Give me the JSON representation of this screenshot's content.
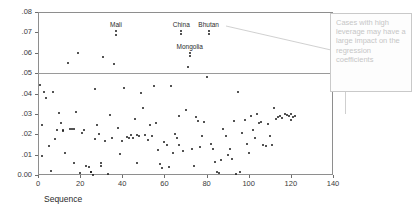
{
  "chart_data": {
    "type": "scatter",
    "title": "",
    "xlabel": "Sequence",
    "ylabel": "Leverage",
    "xlim": [
      0,
      140
    ],
    "ylim": [
      0.0,
      0.08
    ],
    "xticks": [
      "0",
      "20",
      "40",
      "60",
      "80",
      "100",
      "120",
      "140"
    ],
    "xtick_values": [
      0,
      20,
      40,
      60,
      80,
      100,
      120,
      140
    ],
    "yticks": [
      "0.00",
      ".01",
      ".02",
      ".03",
      ".04",
      ".05",
      ".06",
      ".07",
      ".08"
    ],
    "ytick_values": [
      0.0,
      0.01,
      0.02,
      0.03,
      0.04,
      0.05,
      0.06,
      0.07,
      0.08
    ],
    "grid": false,
    "legend": null,
    "reference_lines": [
      {
        "axis": "y",
        "value": 0.05,
        "label": ""
      }
    ],
    "annotations": [
      {
        "text": "Mali",
        "x": 37,
        "y": 0.0707
      },
      {
        "text": "China",
        "x": 68,
        "y": 0.0707
      },
      {
        "text": "Bhutan",
        "x": 81,
        "y": 0.0706
      },
      {
        "text": "Mongolia",
        "x": 72,
        "y": 0.0597
      }
    ],
    "points": [
      {
        "x": 1,
        "y": 0.0443
      },
      {
        "x": 2,
        "y": 0.0247
      },
      {
        "x": 2,
        "y": 0.0094
      },
      {
        "x": 3,
        "y": 0.0405
      },
      {
        "x": 4,
        "y": 0.0378
      },
      {
        "x": 5,
        "y": 0.014
      },
      {
        "x": 6,
        "y": 0.0021
      },
      {
        "x": 7,
        "y": 0.0409
      },
      {
        "x": 8,
        "y": 0.0178
      },
      {
        "x": 9,
        "y": 0.0221
      },
      {
        "x": 10,
        "y": 0.0303
      },
      {
        "x": 11,
        "y": 0.0253
      },
      {
        "x": 12,
        "y": 0.0216
      },
      {
        "x": 12,
        "y": 0.0219
      },
      {
        "x": 13,
        "y": 0.011
      },
      {
        "x": 14,
        "y": 0.0549
      },
      {
        "x": 15,
        "y": 0.0226
      },
      {
        "x": 16,
        "y": 0.0228
      },
      {
        "x": 17,
        "y": 0.0061
      },
      {
        "x": 17,
        "y": 0.0225
      },
      {
        "x": 18,
        "y": 0.0309
      },
      {
        "x": 19,
        "y": 0.06
      },
      {
        "x": 20,
        "y": 0.0012
      },
      {
        "x": 21,
        "y": 0.0206
      },
      {
        "x": 22,
        "y": 0.0219
      },
      {
        "x": 23,
        "y": 0.0042
      },
      {
        "x": 24,
        "y": 0.004
      },
      {
        "x": 25,
        "y": 0.0015
      },
      {
        "x": 25,
        "y": 0.0015
      },
      {
        "x": 26,
        "y": 0.0002
      },
      {
        "x": 27,
        "y": 0.0421
      },
      {
        "x": 27,
        "y": 0.0178
      },
      {
        "x": 28,
        "y": 0.0247
      },
      {
        "x": 29,
        "y": 0.0203
      },
      {
        "x": 30,
        "y": 0.006
      },
      {
        "x": 30,
        "y": 0.0043
      },
      {
        "x": 31,
        "y": 0.0578
      },
      {
        "x": 32,
        "y": 0.0168
      },
      {
        "x": 33,
        "y": 0.0005
      },
      {
        "x": 34,
        "y": 0.0295
      },
      {
        "x": 35,
        "y": 0.0182
      },
      {
        "x": 36,
        "y": 0.0545
      },
      {
        "x": 37,
        "y": 0.0686
      },
      {
        "x": 38,
        "y": 0.0232
      },
      {
        "x": 39,
        "y": 0.0104
      },
      {
        "x": 40,
        "y": 0.0168
      },
      {
        "x": 41,
        "y": 0.0426
      },
      {
        "x": 42,
        "y": 0.0188
      },
      {
        "x": 43,
        "y": 0.0182
      },
      {
        "x": 44,
        "y": 0.0194
      },
      {
        "x": 45,
        "y": 0.018
      },
      {
        "x": 46,
        "y": 0.0273
      },
      {
        "x": 47,
        "y": 0.0058
      },
      {
        "x": 47,
        "y": 0.0196
      },
      {
        "x": 48,
        "y": 0.0192
      },
      {
        "x": 49,
        "y": 0.0404
      },
      {
        "x": 50,
        "y": 0.033
      },
      {
        "x": 51,
        "y": 0.0194
      },
      {
        "x": 52,
        "y": 0.0174
      },
      {
        "x": 53,
        "y": 0.0244
      },
      {
        "x": 54,
        "y": 0.0191
      },
      {
        "x": 55,
        "y": 0.0435
      },
      {
        "x": 56,
        "y": 0.0256
      },
      {
        "x": 57,
        "y": 0.0122
      },
      {
        "x": 58,
        "y": 0.0054
      },
      {
        "x": 59,
        "y": 0.0036
      },
      {
        "x": 60,
        "y": 0.0163
      },
      {
        "x": 61,
        "y": 0.0146
      },
      {
        "x": 62,
        "y": 0.0038
      },
      {
        "x": 63,
        "y": 0.0436
      },
      {
        "x": 64,
        "y": 0.011
      },
      {
        "x": 65,
        "y": 0.0199
      },
      {
        "x": 66,
        "y": 0.018
      },
      {
        "x": 67,
        "y": 0.0149
      },
      {
        "x": 67,
        "y": 0.0289
      },
      {
        "x": 68,
        "y": 0.0691
      },
      {
        "x": 69,
        "y": 0.0118
      },
      {
        "x": 70,
        "y": 0.032
      },
      {
        "x": 71,
        "y": 0.053
      },
      {
        "x": 72,
        "y": 0.0583
      },
      {
        "x": 73,
        "y": 0.0128
      },
      {
        "x": 74,
        "y": 0.0044
      },
      {
        "x": 75,
        "y": 0.0284
      },
      {
        "x": 76,
        "y": 0.0267
      },
      {
        "x": 77,
        "y": 0.0136
      },
      {
        "x": 78,
        "y": 0.0193
      },
      {
        "x": 79,
        "y": 0.0259
      },
      {
        "x": 80,
        "y": 0.0482
      },
      {
        "x": 81,
        "y": 0.069
      },
      {
        "x": 82,
        "y": 0.0153
      },
      {
        "x": 83,
        "y": 0.0128
      },
      {
        "x": 84,
        "y": 0.0065
      },
      {
        "x": 85,
        "y": 0.0013
      },
      {
        "x": 86,
        "y": 0.0008
      },
      {
        "x": 87,
        "y": 0.0073
      },
      {
        "x": 88,
        "y": 0.0224
      },
      {
        "x": 89,
        "y": 0.0192
      },
      {
        "x": 90,
        "y": 0.01
      },
      {
        "x": 91,
        "y": 0.013
      },
      {
        "x": 92,
        "y": 0.0077
      },
      {
        "x": 93,
        "y": 0.0265
      },
      {
        "x": 94,
        "y": 0.0006
      },
      {
        "x": 95,
        "y": 0.0405
      },
      {
        "x": 96,
        "y": 0.0014
      },
      {
        "x": 97,
        "y": 0.0206
      },
      {
        "x": 98,
        "y": 0.0268
      },
      {
        "x": 99,
        "y": 0.0153
      },
      {
        "x": 100,
        "y": 0.011
      },
      {
        "x": 101,
        "y": 0.0292
      },
      {
        "x": 102,
        "y": 0.0222
      },
      {
        "x": 103,
        "y": 0.0182
      },
      {
        "x": 104,
        "y": 0.0298
      },
      {
        "x": 105,
        "y": 0.0253
      },
      {
        "x": 106,
        "y": 0.0258
      },
      {
        "x": 107,
        "y": 0.0145
      },
      {
        "x": 108,
        "y": 0.0144
      },
      {
        "x": 109,
        "y": 0.0248
      },
      {
        "x": 110,
        "y": 0.0193
      },
      {
        "x": 111,
        "y": 0.0148
      },
      {
        "x": 112,
        "y": 0.0329
      },
      {
        "x": 113,
        "y": 0.0276
      },
      {
        "x": 114,
        "y": 0.0284
      },
      {
        "x": 115,
        "y": 0.0291
      },
      {
        "x": 116,
        "y": 0.0281
      },
      {
        "x": 117,
        "y": 0.03
      },
      {
        "x": 118,
        "y": 0.0296
      },
      {
        "x": 119,
        "y": 0.0289
      },
      {
        "x": 120,
        "y": 0.0268
      },
      {
        "x": 120,
        "y": 0.0297
      },
      {
        "x": 121,
        "y": 0.0285
      },
      {
        "x": 122,
        "y": 0.0292
      }
    ]
  },
  "callout": {
    "text": "Cases with high leverage may have a large impact on the regression coefficients",
    "target_label": "Bhutan"
  }
}
